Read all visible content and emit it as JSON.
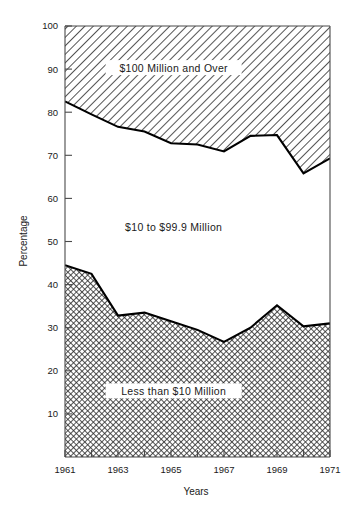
{
  "chart_data": {
    "type": "area",
    "title": "",
    "subtitle": "",
    "xlabel": "Years",
    "ylabel": "Percentage",
    "x": [
      1961,
      1962,
      1963,
      1964,
      1965,
      1966,
      1967,
      1968,
      1969,
      1970,
      1971
    ],
    "xlim": [
      1961,
      1971
    ],
    "ylim": [
      0,
      100
    ],
    "grid": false,
    "legend_position": "inline-annotations",
    "stacked": true,
    "xticks": [
      1961,
      1962,
      1963,
      1964,
      1965,
      1966,
      1967,
      1968,
      1969,
      1970,
      1971
    ],
    "xtick_labels": [
      "1961",
      "",
      "1963",
      "",
      "1965",
      "",
      "1967",
      "",
      "1969",
      "",
      "1971"
    ],
    "yticks": [
      10,
      20,
      30,
      40,
      50,
      60,
      70,
      80,
      90,
      100
    ],
    "ytick_labels": [
      "10",
      "20",
      "30",
      "40",
      "50",
      "60",
      "70",
      "80",
      "90",
      "100"
    ],
    "series": [
      {
        "name": "Less than $10 Million",
        "fill": "crosshatch",
        "values": [
          44.5,
          42.5,
          32.8,
          33.5,
          31.5,
          29.5,
          26.7,
          30.0,
          35.2,
          30.3,
          31.0
        ]
      },
      {
        "name": "$10 to $99.9 Million",
        "fill": "white",
        "values": [
          38.0,
          37.0,
          43.8,
          42.0,
          41.3,
          43.0,
          44.2,
          44.5,
          39.5,
          35.5,
          38.3
        ]
      },
      {
        "name": "$100 Million and Over",
        "fill": "diagonal-hatch",
        "values": [
          17.5,
          20.5,
          23.4,
          24.5,
          27.2,
          27.5,
          29.1,
          25.5,
          25.3,
          34.2,
          30.7
        ]
      }
    ],
    "cumulative_upper_boundary": [
      82.5,
      79.5,
      76.6,
      75.5,
      72.8,
      72.5,
      70.9,
      74.5,
      74.7,
      65.8,
      69.3
    ],
    "cumulative_lower_boundary": [
      44.5,
      42.5,
      32.8,
      33.5,
      31.5,
      29.5,
      26.7,
      30.0,
      35.2,
      30.3,
      31.0
    ],
    "annotations": [
      {
        "text": "$100 Million and Over",
        "x": 1965.1,
        "y": 90
      },
      {
        "text": "$10 to $99.9 Million",
        "x": 1965.1,
        "y": 53
      },
      {
        "text": "Less than $10 Million",
        "x": 1965.1,
        "y": 15
      }
    ],
    "colors": {
      "line": "#000000",
      "axis": "#4a4a4a",
      "text": "#1a1a1a",
      "background": "#ffffff"
    }
  }
}
